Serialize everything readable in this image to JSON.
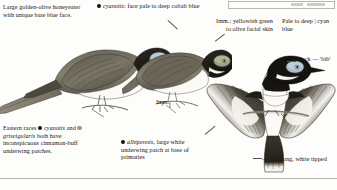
{
  "plate": {
    "title": "Blue-faced Honeyeater identification plate",
    "background_color": "#fdfdfb",
    "text_color": "#17150f",
    "rule_color": "#b4b1a9"
  },
  "captions": {
    "top_left": "Large golden-olive honeyeater with unique bare blue face.",
    "cyanotis_face": "cyanotis: face pale to deep cobalt blue",
    "imm_facial_skin": "Imm.: yellowish green to olive facial skin",
    "pale_to_deep_cyan": "Pale to deep | cyan blue",
    "black_bib": "Black — 'bib'",
    "eastern_races_lead": "Eastern races",
    "eastern_races_mid": "and",
    "eastern_races_tail": "both have inconspicuous cinnamon-buff underwing patches.",
    "race_cyanotis": "cyanotis",
    "race_griseigularis": "griseigularis",
    "race_albipennis": "albipennis",
    "albipennis_note": ", large white underwing patch at base of primaries",
    "tail_note": "— Tail long, white tipped",
    "imm_label": "Imm."
  },
  "figures": {
    "adult_perched": "adult-perched-honeyeater",
    "immature_perched": "immature-perched-honeyeater",
    "flying_underside": "flying-honeyeater-underside"
  },
  "markers": {
    "filled_bullet_color": "#14120e",
    "grey_bullet_color": "#9a978f"
  }
}
